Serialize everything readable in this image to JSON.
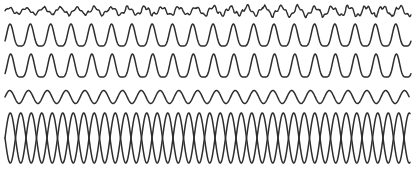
{
  "figure": {
    "background_color": "#ffffff",
    "width": 416,
    "height": 169,
    "axes_visible": false,
    "grid_visible": false,
    "legend_visible": false,
    "tick_labels_visible": false,
    "line_color": "#2e2e2e",
    "line_width": 1.5
  },
  "chart_data": {
    "type": "line",
    "subtitle": "",
    "xlabel": "",
    "ylabel": "",
    "xlim": [
      0,
      416
    ],
    "ylim": [
      0,
      169
    ],
    "grid": false,
    "legend_position": "none",
    "axis_visible": false,
    "x_start": 5,
    "x_end": 411,
    "series": [
      {
        "name": "trace-1-low-amplitude-irregular",
        "shape": "noisy-sine",
        "baseline_y": 11,
        "amplitude": 3.0,
        "period": 17,
        "cycles": 24,
        "phase": 0,
        "jitter_amplitude": 1.4,
        "jitter_period": 5.5,
        "amplitude_ramp_end": 1.6,
        "color": "#2e2e2e",
        "line_width": 1.4
      },
      {
        "name": "trace-2-narrow-peak-train",
        "shape": "raised-cosine-power",
        "baseline_y": 46,
        "amplitude": 22,
        "period": 20.3,
        "cycles": 20,
        "phase": 0.25,
        "peak_sharpness": 2.1,
        "color": "#2e2e2e",
        "line_width": 1.5
      },
      {
        "name": "trace-3-narrow-peak-train",
        "shape": "raised-cosine-power",
        "baseline_y": 77,
        "amplitude": 23,
        "period": 20.3,
        "cycles": 20,
        "phase": 0.22,
        "peak_sharpness": 2.1,
        "color": "#2e2e2e",
        "line_width": 1.5
      },
      {
        "name": "trace-4-medium-sine",
        "shape": "sine",
        "baseline_y": 97,
        "amplitude": 6.5,
        "period": 18.8,
        "cycles": 21.5,
        "phase": 0.0,
        "color": "#2e2e2e",
        "line_width": 1.5
      },
      {
        "name": "trace-5a-large-sine",
        "shape": "sine",
        "baseline_y": 138,
        "amplitude": 25,
        "period": 21.0,
        "cycles": 19.3,
        "phase": 0.0,
        "color": "#2e2e2e",
        "line_width": 1.5
      },
      {
        "name": "trace-5b-large-sine-antiphase",
        "shape": "sine",
        "baseline_y": 138,
        "amplitude": 25,
        "period": 21.0,
        "cycles": 19.3,
        "phase": 0.5,
        "color": "#2e2e2e",
        "line_width": 1.5
      }
    ]
  }
}
